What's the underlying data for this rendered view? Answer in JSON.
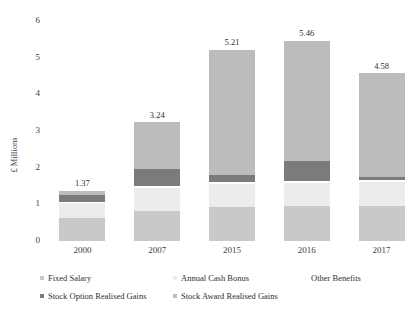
{
  "chart_data": {
    "type": "bar",
    "subtype": "stacked-bar",
    "title": "",
    "xlabel": "",
    "ylabel": "£ Millions",
    "categories": [
      "2000",
      "2007",
      "2015",
      "2016",
      "2017"
    ],
    "ylim": [
      0,
      6
    ],
    "yticks": [
      0,
      1,
      2,
      3,
      4,
      5,
      6
    ],
    "ytick_labels": [
      "0",
      "1",
      "2",
      "3",
      "4",
      "5",
      "6"
    ],
    "grid": false,
    "legend_position": "bottom",
    "totals": [
      1.37,
      3.24,
      5.21,
      5.46,
      4.58
    ],
    "total_labels": [
      "1.37",
      "3.24",
      "5.21",
      "5.46",
      "4.58"
    ],
    "series": [
      {
        "name": "Fixed Salary",
        "color": "#c9c9c9",
        "values": [
          0.62,
          0.82,
          0.93,
          0.95,
          0.96
        ]
      },
      {
        "name": "Annual Cash Bonus",
        "color": "#ececec",
        "values": [
          0.43,
          0.62,
          0.63,
          0.64,
          0.66
        ]
      },
      {
        "name": "Other Benefits",
        "color": "#ffffff",
        "values": [
          0.02,
          0.05,
          0.05,
          0.05,
          0.05
        ]
      },
      {
        "name": "Stock Option Realised Gains",
        "color": "#7b7b7b",
        "values": [
          0.18,
          0.48,
          0.18,
          0.55,
          0.08
        ]
      },
      {
        "name": "Stock Award Realised Gains",
        "color": "#bcbcbc",
        "values": [
          0.12,
          1.27,
          3.42,
          3.27,
          2.83
        ]
      }
    ]
  },
  "axes": {
    "y_title": "£ Millions"
  },
  "legend": {
    "items": [
      {
        "label": "Fixed Salary",
        "color": "#c9c9c9"
      },
      {
        "label": "Annual Cash Bonus",
        "color": "#ececec"
      },
      {
        "label": "Other Benefits",
        "color": "#fbfbfb"
      },
      {
        "label": "Stock Option Realised Gains",
        "color": "#7b7b7b"
      },
      {
        "label": "Stock Award Realised Gains",
        "color": "#bcbcbc"
      }
    ]
  }
}
